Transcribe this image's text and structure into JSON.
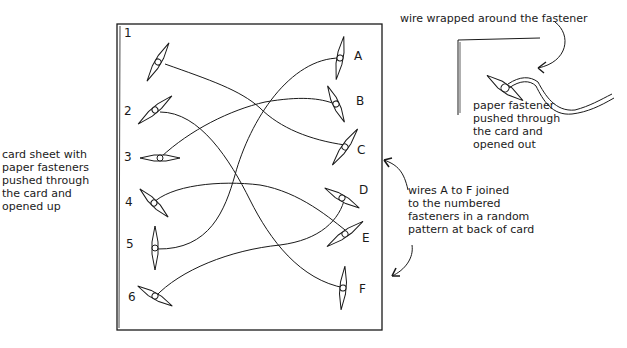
{
  "diagram": {
    "left_pins": [
      {
        "label": "1",
        "x": 127,
        "y": 60
      },
      {
        "label": "2",
        "x": 126,
        "y": 112
      },
      {
        "label": "3",
        "x": 126,
        "y": 158
      },
      {
        "label": "4",
        "x": 127,
        "y": 203
      },
      {
        "label": "5",
        "x": 128,
        "y": 245
      },
      {
        "label": "6",
        "x": 130,
        "y": 298
      }
    ],
    "right_pins": [
      {
        "label": "A",
        "x": 354,
        "y": 56
      },
      {
        "label": "B",
        "x": 356,
        "y": 102
      },
      {
        "label": "C",
        "x": 357,
        "y": 151
      },
      {
        "label": "D",
        "x": 359,
        "y": 191
      },
      {
        "label": "E",
        "x": 362,
        "y": 239
      },
      {
        "label": "F",
        "x": 359,
        "y": 290
      }
    ],
    "connections": [
      {
        "from": "1",
        "to": "C"
      },
      {
        "from": "2",
        "to": "F"
      },
      {
        "from": "3",
        "to": "B"
      },
      {
        "from": "4",
        "to": "E"
      },
      {
        "from": "5",
        "to": "A"
      },
      {
        "from": "6",
        "to": "D"
      }
    ],
    "annotations": {
      "card_sheet": [
        "card sheet with",
        "paper fasteners",
        "pushed through",
        "the card and",
        "opened up"
      ],
      "wire_wrapped": "wire wrapped around the fastener",
      "paper_fastener": [
        "paper fastener",
        "pushed through",
        "the card and",
        "opened out"
      ],
      "wires_joined": [
        "wires A to F joined",
        "to the numbered",
        "fasteners in a random",
        "pattern at back of card"
      ]
    },
    "stroke_color": "#1a1a1a"
  }
}
